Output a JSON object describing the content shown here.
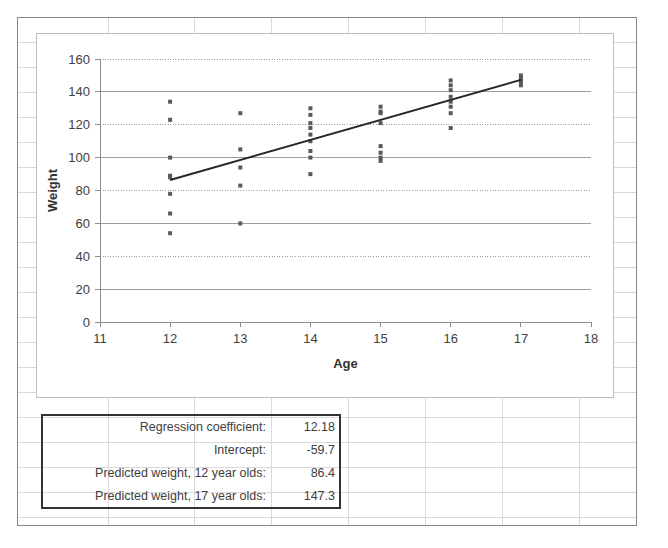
{
  "app": {
    "type": "spreadsheet-chart",
    "background": "#ffffff",
    "grid_color": "#d6d6d6",
    "outline_color": "#888888"
  },
  "chart_data": {
    "type": "scatter",
    "title": "",
    "xlabel": "Age",
    "ylabel": "Weight",
    "xlim": [
      11,
      18
    ],
    "ylim": [
      0,
      160
    ],
    "xticks": [
      11,
      12,
      13,
      14,
      15,
      16,
      17,
      18
    ],
    "yticks": [
      0,
      20,
      40,
      60,
      80,
      100,
      120,
      140,
      160
    ],
    "grid": true,
    "grid_axis": "y",
    "legend": "none",
    "marker_color": "#595959",
    "line_color": "#262626",
    "series": [
      {
        "name": "Weight by Age",
        "type": "scatter",
        "points": [
          [
            12,
            134
          ],
          [
            12,
            123
          ],
          [
            12,
            100
          ],
          [
            12,
            89
          ],
          [
            12,
            88
          ],
          [
            12,
            78
          ],
          [
            12,
            66
          ],
          [
            12,
            54
          ],
          [
            13,
            127
          ],
          [
            13,
            105
          ],
          [
            13,
            94
          ],
          [
            13,
            83
          ],
          [
            13,
            60
          ],
          [
            14,
            130
          ],
          [
            14,
            126
          ],
          [
            14,
            121
          ],
          [
            14,
            118
          ],
          [
            14,
            114
          ],
          [
            14,
            110
          ],
          [
            14,
            104
          ],
          [
            14,
            100
          ],
          [
            14,
            90
          ],
          [
            15,
            131
          ],
          [
            15,
            128
          ],
          [
            15,
            127
          ],
          [
            15,
            121
          ],
          [
            15,
            107
          ],
          [
            15,
            103
          ],
          [
            15,
            100
          ],
          [
            15,
            98
          ],
          [
            16,
            147
          ],
          [
            16,
            144
          ],
          [
            16,
            141
          ],
          [
            16,
            137
          ],
          [
            16,
            134
          ],
          [
            16,
            131
          ],
          [
            16,
            127
          ],
          [
            16,
            118
          ],
          [
            17,
            150
          ],
          [
            17,
            148
          ],
          [
            17,
            147
          ],
          [
            17,
            146
          ],
          [
            17,
            144
          ]
        ]
      },
      {
        "name": "Linear regression line",
        "type": "line",
        "points": [
          [
            12,
            86.4
          ],
          [
            17,
            147.3
          ]
        ]
      }
    ]
  },
  "results": {
    "rows": [
      {
        "label": "Regression coefficient:",
        "value": "12.18"
      },
      {
        "label": "Intercept:",
        "value": "-59.7"
      },
      {
        "label": "Predicted weight, 12 year olds:",
        "value": "86.4"
      },
      {
        "label": "Predicted weight, 17 year olds:",
        "value": "147.3"
      }
    ]
  }
}
